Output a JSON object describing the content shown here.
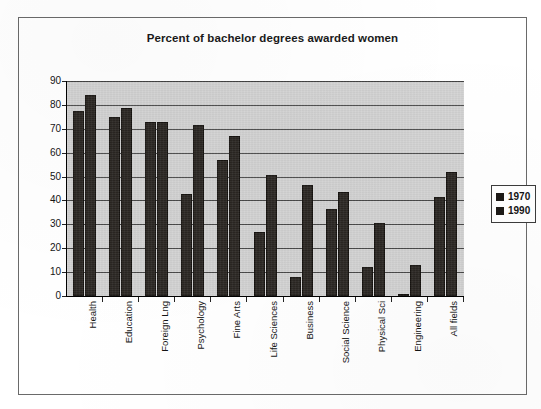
{
  "chart_data": {
    "type": "bar",
    "title": "Percent of bachelor degrees awarded women",
    "xlabel": "",
    "ylabel": "",
    "ylim": [
      0,
      90
    ],
    "yticks": [
      0,
      10,
      20,
      30,
      40,
      50,
      60,
      70,
      80,
      90
    ],
    "ytick_labels": [
      "0",
      "10",
      "20",
      "30",
      "40",
      "50",
      "60",
      "70",
      "80",
      "90"
    ],
    "grid": true,
    "legend_position": "right",
    "categories": [
      "Health",
      "Education",
      "Foreign Lng",
      "Psychology",
      "Fine Arts",
      "Life Sciences",
      "Business",
      "Social Science",
      "Physical Sci",
      "Engineering",
      "All fields"
    ],
    "series": [
      {
        "name": "1970",
        "color": "#2b2723",
        "values": [
          77.5,
          75,
          73,
          42.5,
          57,
          27,
          8,
          36.5,
          12,
          0.5,
          41.5
        ]
      },
      {
        "name": "1990",
        "color": "#2b2723",
        "values": [
          84,
          78.5,
          73,
          71.5,
          67,
          50.5,
          46.5,
          43.5,
          30.5,
          13,
          52
        ]
      }
    ]
  },
  "legend": {
    "entries": [
      {
        "label": "1970"
      },
      {
        "label": "1990"
      }
    ]
  },
  "colors": {
    "plot_background": "#d4d4d4",
    "bar": "#2b2723",
    "gridline": "#4a4a4a",
    "frame": "#6a6a6a",
    "text": "#141414"
  }
}
